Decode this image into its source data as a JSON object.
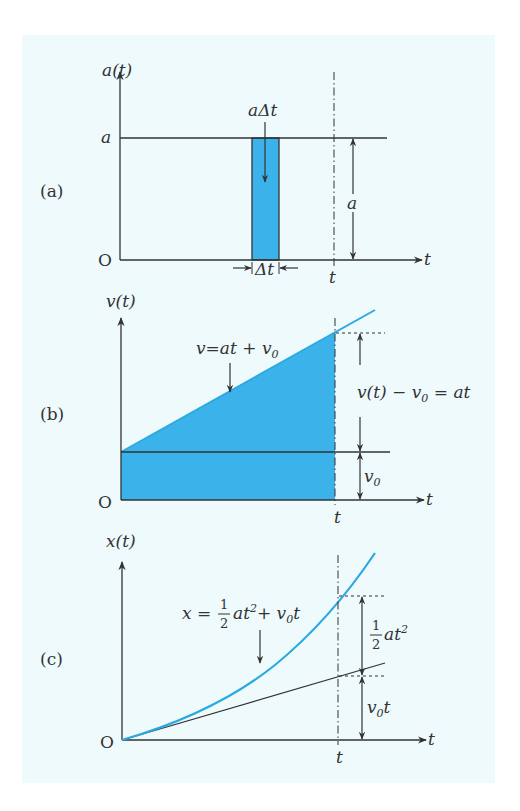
{
  "figure": {
    "background": "#eefafc",
    "fill_color": "#3bb3ea",
    "curve_color": "#2aa9e0",
    "axis_color": "#333333",
    "panels": [
      {
        "id": "a",
        "panel_label": "(a)",
        "y_axis_label": "a(t)",
        "x_axis_label": "t",
        "origin_label": "O",
        "level_label": "a",
        "strip_label": "aΔt",
        "strip_width_label": "Δt",
        "height_label": "a",
        "time_marker_label": "t"
      },
      {
        "id": "b",
        "panel_label": "(b)",
        "y_axis_label": "v(t)",
        "x_axis_label": "t",
        "origin_label": "O",
        "line_equation": {
          "lhs": "v",
          "eq": "=",
          "rhs_main": "at + v",
          "rhs_sub": "0"
        },
        "increase_label": {
          "part1": "v(t) − v",
          "sub": "0",
          "part2": " = at"
        },
        "initial_label": {
          "main": "v",
          "sub": "0"
        },
        "time_marker_label": "t"
      },
      {
        "id": "c",
        "panel_label": "(c)",
        "y_axis_label": "x(t)",
        "x_axis_label": "t",
        "origin_label": "O",
        "curve_equation": {
          "lhs": "x =",
          "frac_num": "1",
          "frac_den": "2",
          "rhs_a": "at",
          "rhs_sup": "2",
          "rhs_b": "+ v",
          "rhs_sub": "0",
          "rhs_c": "t"
        },
        "quadratic_label": {
          "frac_num": "1",
          "frac_den": "2",
          "main": "at",
          "sup": "2"
        },
        "linear_label": {
          "main": "v",
          "sub": "0",
          "tail": "t"
        },
        "time_marker_label": "t"
      }
    ]
  }
}
